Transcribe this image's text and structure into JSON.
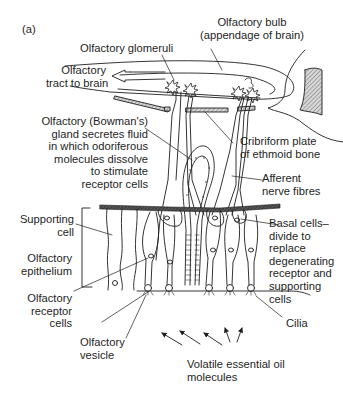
{
  "figure": {
    "panel_label": "(a)",
    "colors": {
      "ink": "#1e1e1e",
      "hatch": "#9a9a9a",
      "background": "#ffffff"
    }
  },
  "labels": {
    "olfactory_bulb": [
      "Olfactory bulb",
      "(appendage of brain)"
    ],
    "olfactory_glomeruli": [
      "Olfactory glomeruli"
    ],
    "olfactory_tract": [
      "Olfactory",
      "tract to brain"
    ],
    "bowmans_gland": [
      "Olfactory (Bowman's)",
      "gland secretes fluid",
      "in which odoriferous",
      "molecules dissolve",
      "to stimulate",
      "receptor cells"
    ],
    "cribriform_plate": [
      "Cribriform plate",
      "of ethmoid bone"
    ],
    "afferent_nerve": [
      "Afferent",
      "nerve fibres"
    ],
    "supporting_cell": [
      "Supporting",
      "cell"
    ],
    "basal_cells": [
      "Basal cells–",
      "divide to",
      "replace",
      "degenerating",
      "receptor and",
      "supporting",
      "cells"
    ],
    "olfactory_epithelium": [
      "Olfactory",
      "epithelium"
    ],
    "olfactory_receptor_cells": [
      "Olfactory",
      "receptor",
      "cells"
    ],
    "cilia": [
      "Cilia"
    ],
    "olfactory_vesicle": [
      "Olfactory",
      "vesicle"
    ],
    "volatile_molecules": [
      "Volatile essential oil",
      "molecules"
    ]
  }
}
